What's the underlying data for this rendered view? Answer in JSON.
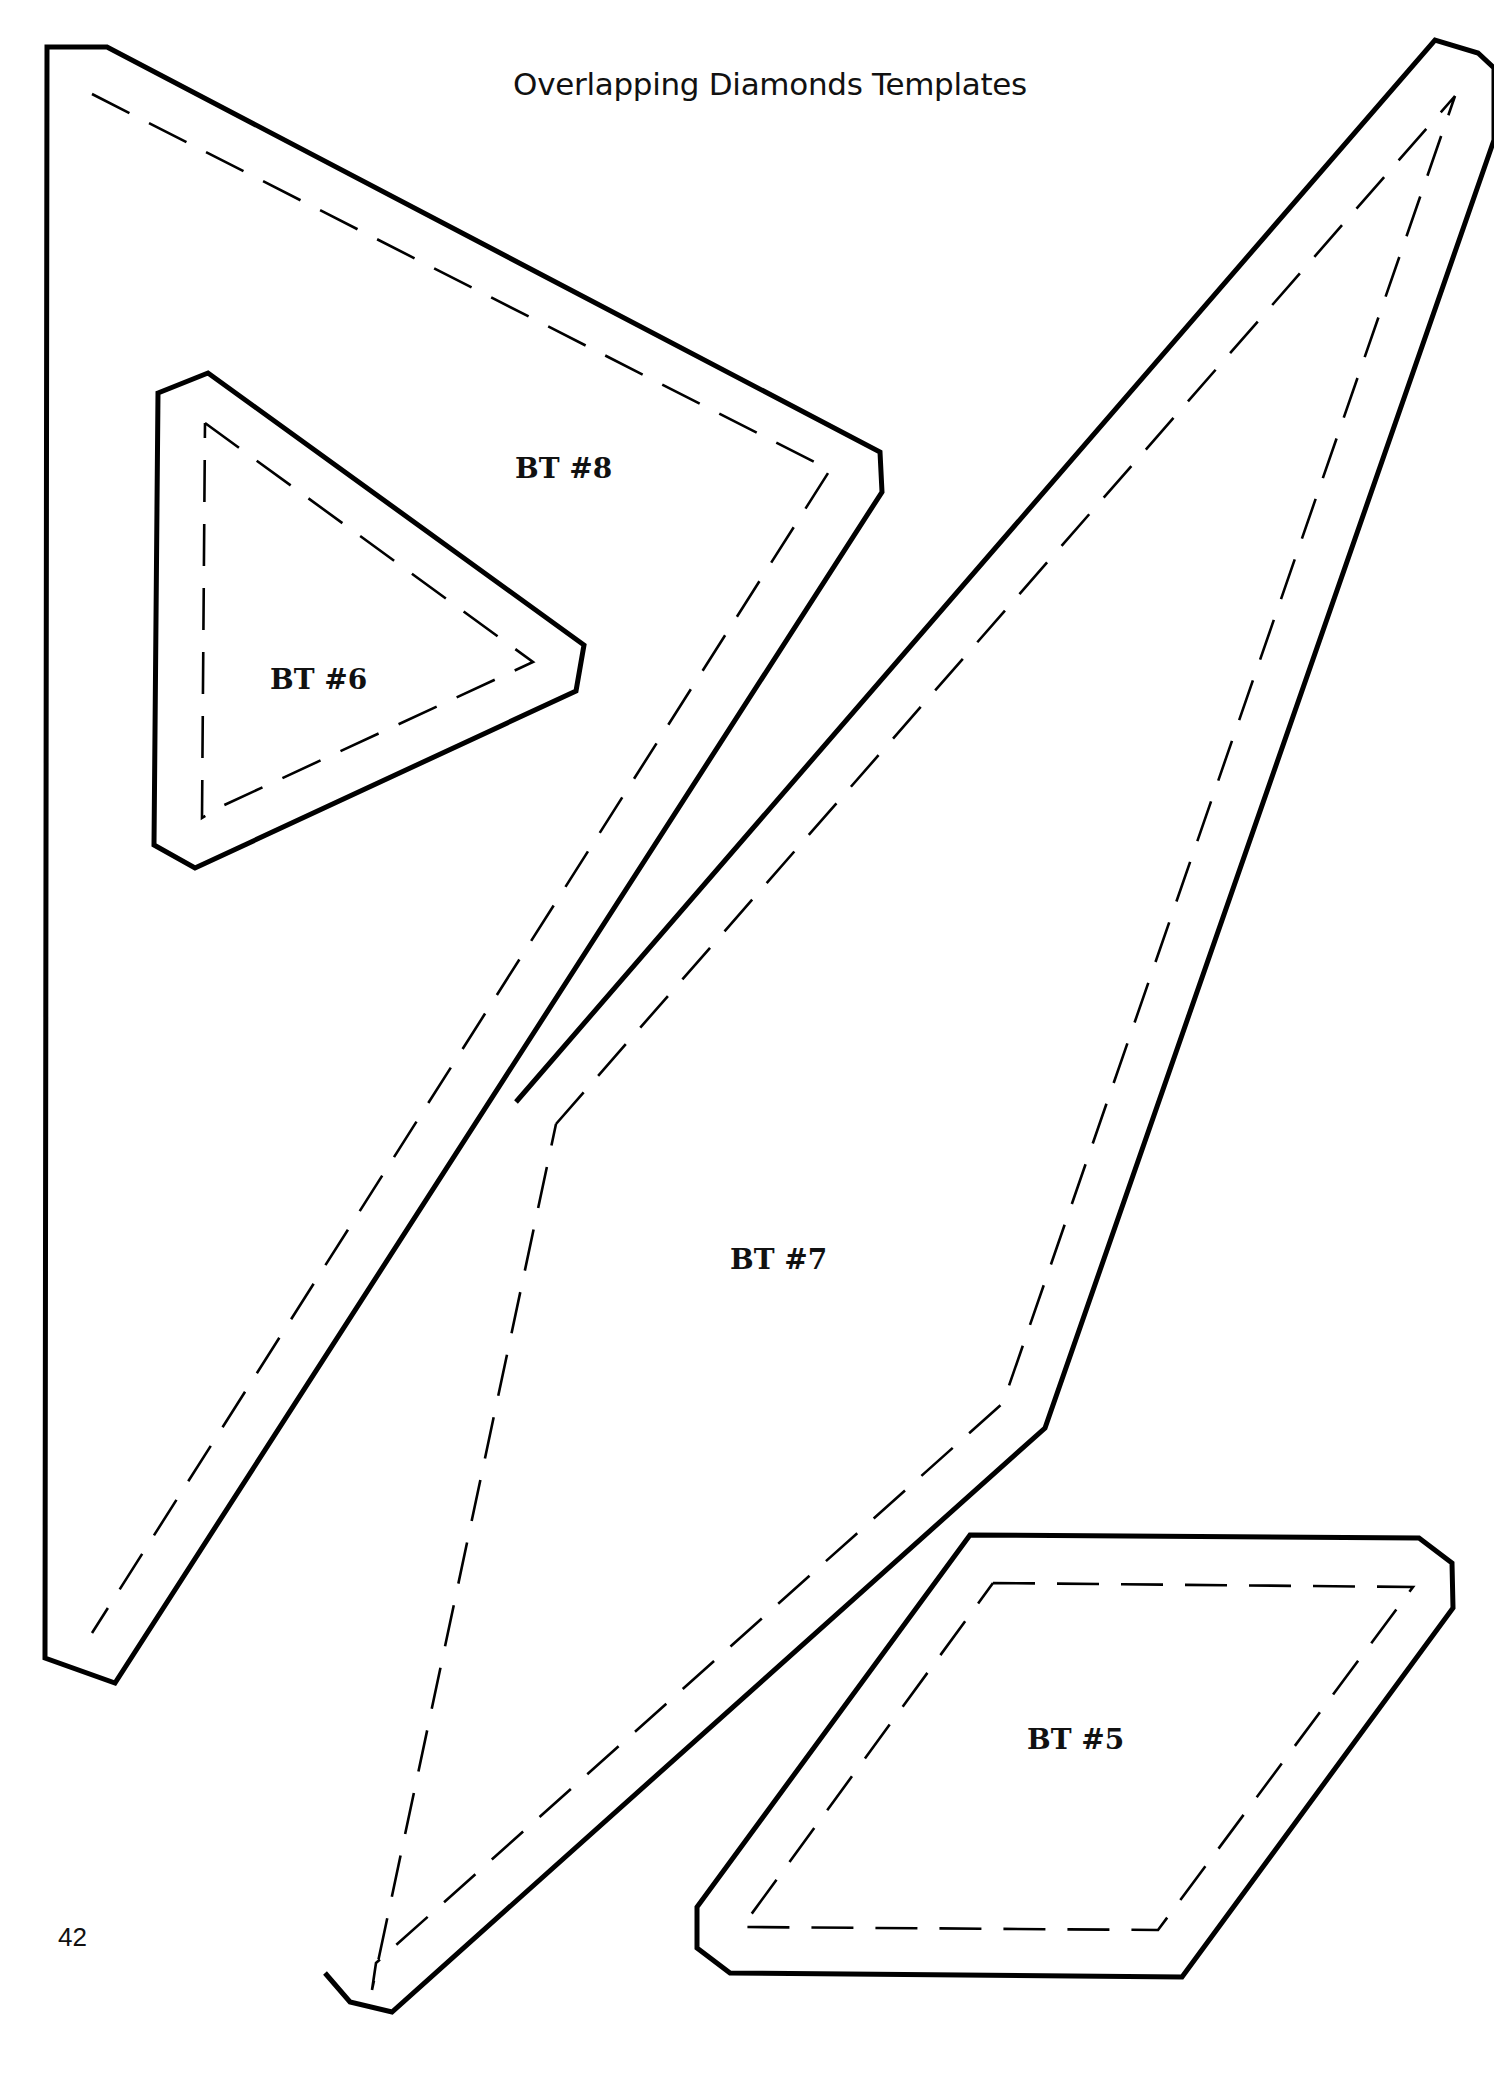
{
  "page": {
    "title": "Overlapping Diamonds Templates",
    "page_number": "42",
    "colors": {
      "background": "#ffffff",
      "ink": "#000000"
    }
  },
  "templates": [
    {
      "id": "bt8",
      "label": "BT #8",
      "label_pos": [
        515,
        452
      ],
      "cut_line": "47,47 107,47 880,452 882,492 115,1683 45,1658",
      "seam_line": "92,94 830,470 92,1633"
    },
    {
      "id": "bt6",
      "label": "BT #6",
      "label_pos": [
        270,
        643
      ],
      "cut_line": "158,393 208,373 584,645 576,691 195,868 154,845",
      "seam_line": "205,423 533,662 220,807 202,818 205,423"
    },
    {
      "id": "bt7",
      "label": "BT #7",
      "label_pos": [
        730,
        1243
      ],
      "cut_line": "516,1102 1435,40 1478,53 1494,68 1494,140 1045,1428 392,2012 350,2002 325,1973",
      "seam_line": "556,1124 1455,96 1003,1403 376,1963 372,1990 556,1124"
    },
    {
      "id": "bt5",
      "label": "BT #5",
      "label_pos": [
        1027,
        1723
      ],
      "cut_line": "970,1535 1419,1538 1452,1563 1453,1608 1182,1977 730,1973 697,1948 697,1907",
      "seam_line": "993,1583 1413,1587 1158,1930 742,1927 993,1583"
    }
  ]
}
